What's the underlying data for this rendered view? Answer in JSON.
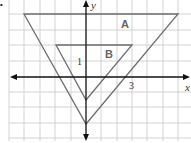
{
  "figure": {
    "bullet": "•",
    "axes": {
      "x_label": "x",
      "y_label": "y",
      "tick_label_x": "3",
      "tick_label_y": "1"
    },
    "shapes": [
      {
        "label": "A",
        "vertices": [
          [
            -4,
            4
          ],
          [
            6,
            4
          ],
          [
            0,
            -3
          ]
        ]
      },
      {
        "label": "B",
        "vertices": [
          [
            -2,
            2
          ],
          [
            3,
            2
          ],
          [
            0,
            -1.5
          ]
        ]
      }
    ],
    "grid": {
      "x_range": [
        -5.5,
        6.5
      ],
      "y_range": [
        -4,
        5
      ],
      "unit_px": 15.3
    },
    "colors": {
      "grid": "#c8c8c8",
      "axes": "#111111",
      "triangle_stroke": "#6e6e6e",
      "label": "#666666"
    }
  }
}
